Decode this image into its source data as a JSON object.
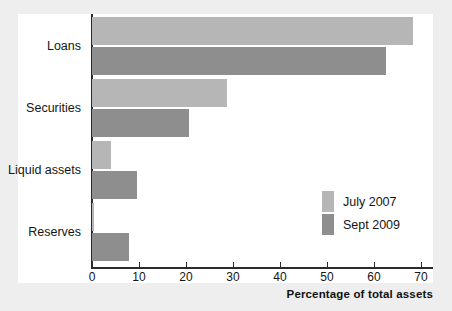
{
  "chart_data": {
    "type": "bar",
    "orientation": "horizontal",
    "title": "",
    "subtitle": "",
    "xlabel": "Percentage of total assets",
    "ylabel": "",
    "categories": [
      "Loans",
      "Securities",
      "Liquid assets",
      "Reserves"
    ],
    "series": [
      {
        "name": "July 2007",
        "color": "#b6b6b6",
        "values": [
          68.3,
          28.7,
          4.0,
          0.5
        ]
      },
      {
        "name": "Sept 2009",
        "color": "#8e8e8e",
        "values": [
          62.6,
          20.6,
          9.6,
          7.9
        ]
      }
    ],
    "xlim": [
      0,
      73
    ],
    "xticks": [
      0,
      10,
      20,
      30,
      40,
      50,
      60,
      70
    ],
    "xtick_labels": [
      "0",
      "10",
      "20",
      "30",
      "40",
      "50",
      "60",
      "70"
    ],
    "grid": false,
    "legend_position": "inside-right-lower",
    "legend_entries": [
      "July 2007",
      "Sept 2009"
    ]
  },
  "figure": {
    "background_color": "#eeeeee",
    "plot_background_color": "#ffffff",
    "axis_color": "#2b2b2b"
  }
}
